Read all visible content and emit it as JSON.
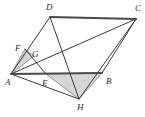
{
  "figure": {
    "kind": "geometry-diagram",
    "width": 145,
    "height": 117,
    "background_color": "#ffffff",
    "stroke_color": "#3a3a3a",
    "thick_stroke_color": "#4a4a4a",
    "shade_fill_color": "#d5d5d5",
    "shade_stroke_color": "#6e6e6e",
    "label_color": "#2b2b2b"
  },
  "points": {
    "A": {
      "label": "A",
      "x": 11,
      "y": 74,
      "label_x": 5,
      "label_y": 78
    },
    "B": {
      "label": "B",
      "x": 102,
      "y": 73,
      "label_x": 106,
      "label_y": 77
    },
    "C": {
      "label": "C",
      "x": 136,
      "y": 19,
      "label_x": 135,
      "label_y": 4
    },
    "D": {
      "label": "D",
      "x": 50,
      "y": 17,
      "label_x": 46,
      "label_y": 3
    },
    "E": {
      "label": "E",
      "x": 46,
      "y": 74,
      "label_x": 42,
      "label_y": 79
    },
    "F": {
      "label": "F",
      "x": 25,
      "y": 49,
      "label_x": 15,
      "label_y": 44
    },
    "G": {
      "label": "G",
      "x": 34,
      "y": 56,
      "label_x": 32,
      "label_y": 50
    },
    "H": {
      "label": "H",
      "x": 79,
      "y": 99,
      "label_x": 77,
      "label_y": 103
    }
  },
  "segments": [
    {
      "name": "side-DC",
      "from": "D",
      "to": "C",
      "weight": "thick"
    },
    {
      "name": "side-AB",
      "from": "A",
      "to": "B",
      "weight": "thick"
    },
    {
      "name": "side-BC",
      "from": "B",
      "to": "C",
      "weight": "thin"
    },
    {
      "name": "side-AD",
      "from": "A",
      "to": "D",
      "weight": "thin"
    },
    {
      "name": "diagonal-AC",
      "from": "A",
      "to": "C",
      "weight": "thin"
    },
    {
      "name": "cevian-DH",
      "from": "D",
      "to": "H",
      "weight": "thin"
    },
    {
      "name": "cevian-AH",
      "from": "A",
      "to": "H",
      "weight": "thin"
    },
    {
      "name": "cevian-CH",
      "from": "C",
      "to": "H",
      "weight": "thin"
    },
    {
      "name": "segment-FE",
      "from": "F",
      "to": "E",
      "weight": "thin"
    }
  ],
  "shaded_regions": [
    {
      "name": "triangle-AFG",
      "vertices": [
        "A",
        "F",
        "G"
      ]
    },
    {
      "name": "triangle-EBH",
      "vertices": [
        "E",
        "B",
        "H"
      ]
    }
  ]
}
